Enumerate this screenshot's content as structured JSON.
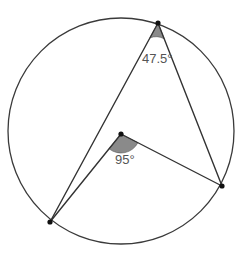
{
  "diagram": {
    "type": "circle-theorem",
    "circle": {
      "cx": 121,
      "cy": 131,
      "r": 113
    },
    "points": {
      "top": {
        "x": 158,
        "y": 23
      },
      "bottom_left": {
        "x": 50,
        "y": 222
      },
      "right": {
        "x": 222,
        "y": 186
      },
      "center": {
        "x": 121,
        "y": 134
      }
    },
    "angles": {
      "inscribed": {
        "label": "47.5°",
        "value": 47.5,
        "vertex": "top"
      },
      "central": {
        "label": "95°",
        "value": 95,
        "vertex": "center"
      }
    },
    "colors": {
      "line": "#333333",
      "sector_fill": "#8a8a8a",
      "label": "#555555",
      "background": "#ffffff"
    }
  }
}
